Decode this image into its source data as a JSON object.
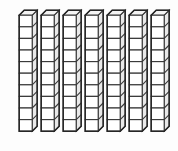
{
  "figure": {
    "name": "base-ten-blocks",
    "description": "Base ten blocks: seven tens rods",
    "background_color": "#fdfdfd",
    "outline_color": "#262626",
    "edge_color": "#3a3a3a",
    "front_face_color": "#ffffff",
    "top_face_color": "#f4f4f4",
    "side_face_color": "#e9e9e9"
  },
  "chart_data": {
    "type": "bar",
    "title": "",
    "subtitle": "",
    "xlabel": "",
    "ylabel": "",
    "categories": [
      "Rod 1",
      "Rod 2",
      "Rod 3",
      "Rod 4",
      "Rod 5",
      "Rod 6",
      "Rod 7"
    ],
    "values": [
      10,
      10,
      10,
      10,
      10,
      10,
      10
    ],
    "series": [
      {
        "name": "Units per rod",
        "values": [
          10,
          10,
          10,
          10,
          10,
          10,
          10
        ]
      }
    ],
    "ylim": [
      0,
      10
    ],
    "grid": false,
    "legend": "none",
    "annotations": [],
    "total_units": 70,
    "rod_count": 7,
    "units_per_rod": 10,
    "place_value": "tens"
  },
  "rods": [
    {
      "id": "rod-1",
      "index": 1,
      "units": 10,
      "left": 18,
      "top": 9
    },
    {
      "id": "rod-2",
      "index": 2,
      "units": 10,
      "left": 40,
      "top": 9
    },
    {
      "id": "rod-3",
      "index": 3,
      "units": 10,
      "left": 62,
      "top": 9
    },
    {
      "id": "rod-4",
      "index": 4,
      "units": 10,
      "left": 84,
      "top": 9
    },
    {
      "id": "rod-5",
      "index": 5,
      "units": 10,
      "left": 106,
      "top": 9
    },
    {
      "id": "rod-6",
      "index": 6,
      "units": 10,
      "left": 128,
      "top": 9
    },
    {
      "id": "rod-7",
      "index": 7,
      "units": 10,
      "left": 150,
      "top": 9
    }
  ],
  "geometry": {
    "cube_width": 13,
    "cube_height": 11.6,
    "depth_x": 5,
    "depth_y": 5
  }
}
